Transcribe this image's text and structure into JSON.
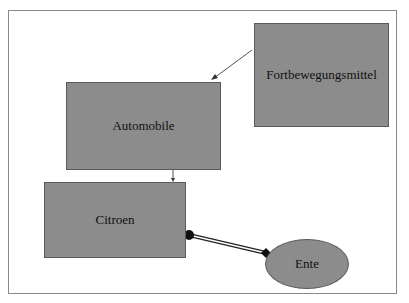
{
  "diagram": {
    "nodes": [
      {
        "id": "fortbewegungsmittel",
        "label": "Fortbewegungsmittel",
        "shape": "rectangle"
      },
      {
        "id": "automobile",
        "label": "Automobile",
        "shape": "rectangle"
      },
      {
        "id": "citroen",
        "label": "Citroen",
        "shape": "rectangle"
      },
      {
        "id": "ente",
        "label": "Ente",
        "shape": "ellipse"
      }
    ],
    "edges": [
      {
        "from": "fortbewegungsmittel",
        "to": "automobile",
        "type": "arrow"
      },
      {
        "from": "automobile",
        "to": "citroen",
        "type": "arrow"
      },
      {
        "from": "citroen",
        "to": "ente",
        "type": "double-line-association"
      }
    ],
    "colors": {
      "node_fill": "#8c8c8c",
      "border": "#5a5a5a",
      "frame": "#8a8a8a"
    }
  }
}
